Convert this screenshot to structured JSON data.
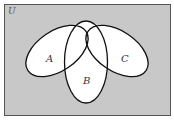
{
  "diagram": {
    "type": "venn",
    "universe_label": "U",
    "colors": {
      "universe_fill": "#c8c8c8",
      "universe_border": "#555555",
      "set_fill": "#ffffff",
      "set_stroke": "#111111"
    },
    "sets": [
      {
        "label": "A",
        "position": "left",
        "orientation": "tilted"
      },
      {
        "label": "B",
        "position": "center-bottom",
        "orientation": "vertical"
      },
      {
        "label": "C",
        "position": "right",
        "orientation": "tilted"
      }
    ]
  }
}
